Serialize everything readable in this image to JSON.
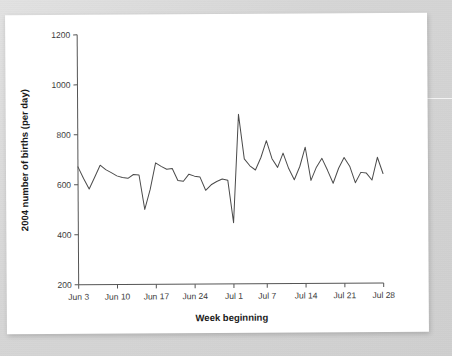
{
  "figure": {
    "background_color": "#ffffff",
    "scan_background_color": "#d6d6d6",
    "line_color": "#4a4a4a"
  },
  "chart_data": {
    "type": "line",
    "title": "",
    "xlabel": "Week beginning",
    "ylabel": "2004 number of births (per day)",
    "ylim": [
      200,
      1200
    ],
    "ytick_labels": [
      "200",
      "400",
      "600",
      "800",
      "1000",
      "1200"
    ],
    "ytick_values": [
      200,
      400,
      600,
      800,
      1000,
      1200
    ],
    "xtick_labels": [
      "Jun 3",
      "Jun 10",
      "Jun 17",
      "Jun 24",
      "Jul 1",
      "Jul 7",
      "Jul 14",
      "Jul 21",
      "Jul 28"
    ],
    "xtick_indices": [
      0,
      7,
      14,
      21,
      28,
      34,
      41,
      48,
      55
    ],
    "grid": false,
    "legend": "none",
    "series": [
      {
        "name": "2004 number of births (per day)",
        "x": [
          0,
          1,
          2,
          3,
          4,
          5,
          6,
          7,
          8,
          9,
          10,
          11,
          12,
          13,
          14,
          15,
          16,
          17,
          18,
          19,
          20,
          21,
          22,
          23,
          24,
          25,
          26,
          27,
          28,
          29,
          30,
          31,
          32,
          33,
          34,
          35,
          36,
          37,
          38,
          39,
          40,
          41,
          42,
          43,
          44,
          45,
          46,
          47,
          48,
          49,
          50,
          51,
          52,
          53,
          54,
          55
        ],
        "values": [
          672,
          625,
          583,
          630,
          678,
          660,
          648,
          635,
          628,
          625,
          640,
          638,
          500,
          580,
          686,
          672,
          660,
          663,
          615,
          612,
          640,
          632,
          628,
          575,
          597,
          610,
          620,
          615,
          445,
          878,
          700,
          672,
          655,
          705,
          772,
          700,
          665,
          722,
          660,
          615,
          668,
          745,
          612,
          665,
          700,
          652,
          600,
          660,
          703,
          668,
          602,
          643,
          640,
          612,
          703,
          638
        ]
      }
    ],
    "annotations": [
      {
        "label": "peak",
        "x_index": 29,
        "value": 878
      },
      {
        "label": "trough",
        "x_index": 28,
        "value": 445
      }
    ]
  }
}
